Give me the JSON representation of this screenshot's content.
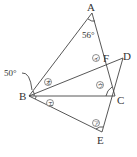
{
  "diagram": {
    "points": {
      "A": {
        "label": "A",
        "x": 92,
        "y": 13
      },
      "B": {
        "label": "B",
        "x": 29,
        "y": 96
      },
      "C": {
        "label": "C",
        "x": 115,
        "y": 96
      },
      "D": {
        "label": "D",
        "x": 123,
        "y": 58
      },
      "E": {
        "label": "E",
        "x": 102,
        "y": 132
      },
      "F": {
        "label": "F",
        "x": 104,
        "y": 58
      }
    },
    "angles": {
      "angle_A": "56°",
      "angle_B": "50°"
    },
    "markers": {
      "a": "ア",
      "i": "イ",
      "u": "ウ",
      "e": "エ",
      "o": "オ"
    },
    "colors": {
      "line": "#444444",
      "text": "#333333",
      "background": "#ffffff"
    }
  }
}
